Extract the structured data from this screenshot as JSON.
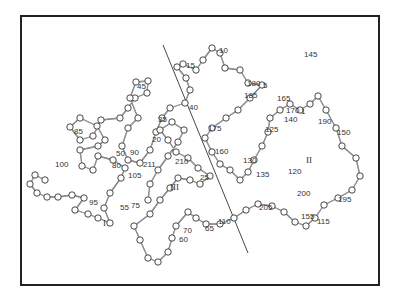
{
  "figure": {
    "type": "protein C-alpha backbone trace",
    "frame_color": "#222222",
    "line_color": "#444444",
    "atom_fill": "#ffffff",
    "residue_labels": [
      {
        "text": "1",
        "x": 301,
        "y": 114
      },
      {
        "text": "5",
        "x": 263,
        "y": 88
      },
      {
        "text": "10",
        "x": 219,
        "y": 53
      },
      {
        "text": "15",
        "x": 186,
        "y": 68
      },
      {
        "text": "20",
        "x": 152,
        "y": 142
      },
      {
        "text": "25",
        "x": 200,
        "y": 180
      },
      {
        "text": "35",
        "x": 158,
        "y": 122
      },
      {
        "text": "40",
        "x": 189,
        "y": 110
      },
      {
        "text": "45",
        "x": 137,
        "y": 89
      },
      {
        "text": "50",
        "x": 116,
        "y": 156
      },
      {
        "text": "55",
        "x": 120,
        "y": 210
      },
      {
        "text": "60",
        "x": 179,
        "y": 242
      },
      {
        "text": "65",
        "x": 205,
        "y": 231
      },
      {
        "text": "70",
        "x": 183,
        "y": 233
      },
      {
        "text": "75",
        "x": 131,
        "y": 208
      },
      {
        "text": "80",
        "x": 112,
        "y": 168
      },
      {
        "text": "85",
        "x": 74,
        "y": 134
      },
      {
        "text": "90",
        "x": 130,
        "y": 155
      },
      {
        "text": "95",
        "x": 89,
        "y": 205
      },
      {
        "text": "100",
        "x": 55,
        "y": 167
      },
      {
        "text": "105",
        "x": 128,
        "y": 178
      },
      {
        "text": "110",
        "x": 218,
        "y": 224
      },
      {
        "text": "115",
        "x": 317,
        "y": 224
      },
      {
        "text": "120",
        "x": 288,
        "y": 174
      },
      {
        "text": "125",
        "x": 265,
        "y": 132
      },
      {
        "text": "130",
        "x": 243,
        "y": 163
      },
      {
        "text": "135",
        "x": 256,
        "y": 177
      },
      {
        "text": "140",
        "x": 284,
        "y": 122
      },
      {
        "text": "145",
        "x": 304,
        "y": 57
      },
      {
        "text": "150",
        "x": 337,
        "y": 135
      },
      {
        "text": "155",
        "x": 301,
        "y": 219
      },
      {
        "text": "160",
        "x": 215,
        "y": 154
      },
      {
        "text": "165",
        "x": 277,
        "y": 101
      },
      {
        "text": "170",
        "x": 286,
        "y": 113
      },
      {
        "text": "175",
        "x": 208,
        "y": 131
      },
      {
        "text": "180",
        "x": 247,
        "y": 86
      },
      {
        "text": "185",
        "x": 244,
        "y": 98
      },
      {
        "text": "190",
        "x": 318,
        "y": 124
      },
      {
        "text": "195",
        "x": 338,
        "y": 202
      },
      {
        "text": "200",
        "x": 297,
        "y": 196
      },
      {
        "text": "205",
        "x": 259,
        "y": 210
      },
      {
        "text": "210",
        "x": 175,
        "y": 164
      },
      {
        "text": "211",
        "x": 143,
        "y": 167
      }
    ],
    "domain_labels": [
      {
        "text": "I",
        "x": 103,
        "y": 226
      },
      {
        "text": "II",
        "x": 306,
        "y": 163
      },
      {
        "text": "III",
        "x": 170,
        "y": 190
      }
    ],
    "divider_lines": [
      {
        "x1": 163,
        "y1": 45,
        "x2": 248,
        "y2": 253
      }
    ]
  }
}
